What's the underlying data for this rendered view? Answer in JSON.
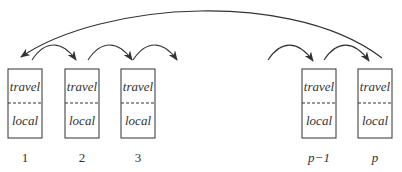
{
  "diagram": {
    "colors": {
      "stroke": "#333333",
      "background": "#ffffff"
    },
    "processors": [
      {
        "label": "1",
        "top": "travel",
        "bottom": "local",
        "x": 8
      },
      {
        "label": "2",
        "top": "travel",
        "bottom": "local",
        "x": 65
      },
      {
        "label": "3",
        "top": "travel",
        "bottom": "local",
        "x": 121
      },
      {
        "label": "p−1",
        "top": "travel",
        "bottom": "local",
        "x": 302
      },
      {
        "label": "p",
        "top": "travel",
        "bottom": "local",
        "x": 358
      }
    ],
    "arrows": [
      {
        "from": "1",
        "to": "2",
        "type": "neighbor-shift"
      },
      {
        "from": "2",
        "to": "3",
        "type": "neighbor-shift"
      },
      {
        "from": "3",
        "to": "…",
        "type": "neighbor-shift"
      },
      {
        "from": "…",
        "to": "p−1",
        "type": "neighbor-shift"
      },
      {
        "from": "p−1",
        "to": "p",
        "type": "neighbor-shift"
      },
      {
        "from": "p",
        "to": "1",
        "type": "wrap-around"
      }
    ]
  }
}
